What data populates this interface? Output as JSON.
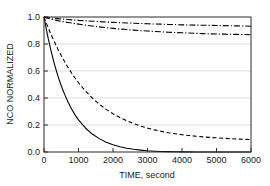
{
  "chart_data": {
    "type": "line",
    "title": "",
    "xlabel": "TIME, second",
    "ylabel": "NCO NORMALIZED",
    "xlim": [
      0,
      6000
    ],
    "ylim": [
      0.0,
      1.0
    ],
    "xticks": [
      0,
      1000,
      2000,
      3000,
      4000,
      5000,
      6000
    ],
    "xticklabels": [
      "0",
      "1000",
      "2000",
      "3000",
      "4000",
      "5000",
      "6000"
    ],
    "yticks": [
      0.0,
      0.2,
      0.4,
      0.6,
      0.8,
      1.0
    ],
    "yticklabels": [
      "0.0",
      "0.2",
      "0.4",
      "0.6",
      "0.8",
      "1.0"
    ],
    "grid": {
      "horizontal": true,
      "vertical": false,
      "color": "#c8c8c8"
    },
    "legend": {
      "visible": false,
      "position": "none"
    },
    "frame": {
      "visible": true,
      "color": "#2b2b2b"
    },
    "x": [
      0,
      100,
      200,
      300,
      400,
      500,
      600,
      700,
      800,
      900,
      1000,
      1200,
      1400,
      1600,
      1800,
      2000,
      2200,
      2400,
      2600,
      2800,
      3000,
      3200,
      3400,
      3600,
      3800,
      4000,
      4200,
      4400,
      4600,
      4800,
      5000,
      5200,
      5400,
      5600,
      5800,
      6000
    ],
    "series": [
      {
        "name": "curve-solid",
        "style": "solid",
        "color": "#000000",
        "values": [
          1.0,
          0.868,
          0.753,
          0.653,
          0.566,
          0.491,
          0.425,
          0.368,
          0.318,
          0.275,
          0.238,
          0.178,
          0.133,
          0.099,
          0.073,
          0.054,
          0.039,
          0.028,
          0.02,
          0.014,
          0.009,
          0.006,
          0.004,
          0.003,
          0.002,
          0.001,
          0.001,
          0.0,
          0.0,
          0.0,
          0.0,
          0.0,
          0.0,
          0.0,
          0.0,
          0.0
        ]
      },
      {
        "name": "curve-dashed",
        "style": "dashed",
        "color": "#000000",
        "values": [
          1.0,
          0.934,
          0.873,
          0.816,
          0.763,
          0.714,
          0.668,
          0.625,
          0.585,
          0.548,
          0.513,
          0.452,
          0.4,
          0.355,
          0.316,
          0.283,
          0.255,
          0.231,
          0.21,
          0.192,
          0.177,
          0.164,
          0.153,
          0.143,
          0.135,
          0.128,
          0.122,
          0.117,
          0.112,
          0.108,
          0.105,
          0.102,
          0.099,
          0.096,
          0.094,
          0.092
        ]
      },
      {
        "name": "curve-dashdot-upper",
        "style": "dashdot",
        "color": "#000000",
        "values": [
          1.0,
          0.996,
          0.993,
          0.99,
          0.988,
          0.985,
          0.983,
          0.981,
          0.979,
          0.977,
          0.975,
          0.972,
          0.969,
          0.966,
          0.963,
          0.96,
          0.958,
          0.956,
          0.954,
          0.952,
          0.95,
          0.948,
          0.947,
          0.945,
          0.944,
          0.942,
          0.941,
          0.94,
          0.939,
          0.938,
          0.937,
          0.936,
          0.935,
          0.934,
          0.933,
          0.932
        ]
      },
      {
        "name": "curve-dashdot-lower",
        "style": "dashdot",
        "color": "#000000",
        "values": [
          1.0,
          0.991,
          0.984,
          0.978,
          0.973,
          0.968,
          0.963,
          0.959,
          0.955,
          0.951,
          0.947,
          0.94,
          0.933,
          0.927,
          0.921,
          0.916,
          0.911,
          0.907,
          0.903,
          0.899,
          0.896,
          0.893,
          0.89,
          0.887,
          0.885,
          0.883,
          0.881,
          0.879,
          0.877,
          0.875,
          0.874,
          0.873,
          0.872,
          0.871,
          0.87,
          0.869
        ]
      }
    ]
  }
}
